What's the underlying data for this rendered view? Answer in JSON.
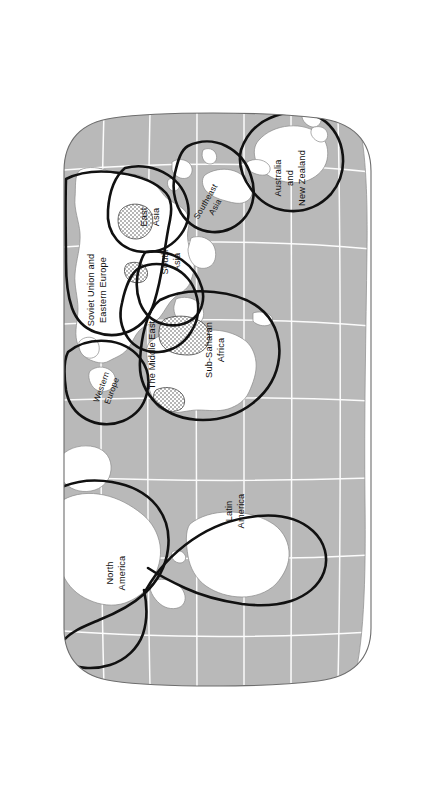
{
  "figure": {
    "projection": "oval (Robinson-like) world projection",
    "orientation": "rotated 90 degrees clockwise; north is at the left of the page",
    "colors": {
      "ocean": "#b9b9b9",
      "land": "#ffffff",
      "land_outline": "#8a8a8a",
      "graticule": "#ffffff",
      "region_boundary": "#111111",
      "page_background": "#ffffff",
      "stipple": "#4a4a4a"
    }
  },
  "regions": [
    {
      "id": "soviet-union-and-eastern-europe",
      "label": "Soviet Union and Eastern Europe",
      "lines": [
        "Soviet Union and",
        "Eastern Europe"
      ]
    },
    {
      "id": "east-asia",
      "label": "East Asia",
      "lines": [
        "East",
        "Asia"
      ]
    },
    {
      "id": "south-asia",
      "label": "South Asia",
      "lines": [
        "South",
        "Asia"
      ]
    },
    {
      "id": "southeast-asia",
      "label": "Southeast Asia",
      "lines": [
        "Southeast",
        "Asia"
      ]
    },
    {
      "id": "australia-and-new-zealand",
      "label": "Australia and New Zealand",
      "lines": [
        "Australia",
        "and",
        "New Zealand"
      ]
    },
    {
      "id": "western-europe",
      "label": "Western Europe",
      "lines": [
        "Western",
        "Europe"
      ]
    },
    {
      "id": "the-middle-east",
      "label": "The Middle East",
      "lines": [
        "The Middle East"
      ]
    },
    {
      "id": "sub-saharan-africa",
      "label": "Sub-Saharan Africa",
      "lines": [
        "Sub-Saharan",
        "Africa"
      ]
    },
    {
      "id": "north-america",
      "label": "North America",
      "lines": [
        "North",
        "America"
      ]
    },
    {
      "id": "latin-america",
      "label": "Latin America",
      "lines": [
        "Latin",
        "America"
      ]
    }
  ],
  "labels": {
    "soviet_line1": "Soviet Union and",
    "soviet_line2": "Eastern Europe",
    "east_asia_line1": "East",
    "east_asia_line2": "Asia",
    "south_asia_line1": "South",
    "south_asia_line2": "Asia",
    "southeast_asia_line1": "Southeast",
    "southeast_asia_line2": "Asia",
    "australia_line1": "Australia",
    "australia_line2": "and",
    "australia_line3": "New Zealand",
    "western_europe_line1": "Western",
    "western_europe_line2": "Europe",
    "middle_east_line1": "The Middle East",
    "africa_line1": "Sub-Saharan",
    "africa_line2": "Africa",
    "north_america_line1": "North",
    "north_america_line2": "America",
    "latin_america_line1": "Latin",
    "latin_america_line2": "America"
  }
}
